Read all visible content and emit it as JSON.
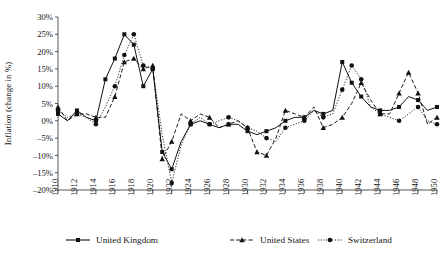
{
  "chart_data": {
    "type": "line",
    "title": "",
    "xlabel": "",
    "ylabel": "Inflation (change in %)",
    "xlim": [
      1910,
      1950
    ],
    "ylim": [
      -20,
      30
    ],
    "ytick_step": 5,
    "xtick_step": 2,
    "grid": false,
    "legend_position": "bottom",
    "ytick_labels": [
      "30%",
      "25%",
      "20%",
      "15%",
      "10%",
      "5%",
      "0%",
      "–5%",
      "–10%",
      "–15%",
      "–20%"
    ],
    "ytick_values": [
      30,
      25,
      20,
      15,
      10,
      5,
      0,
      -5,
      -10,
      -15,
      -20
    ],
    "xtick_labels": [
      "1910",
      "1912",
      "1914",
      "1916",
      "1918",
      "1920",
      "1922",
      "1924",
      "1926",
      "1928",
      "1930",
      "1932",
      "1934",
      "1936",
      "1938",
      "1940",
      "1942",
      "1944",
      "1946",
      "1948",
      "1950"
    ],
    "xtick_values": [
      1910,
      1912,
      1914,
      1916,
      1918,
      1920,
      1922,
      1924,
      1926,
      1928,
      1930,
      1932,
      1934,
      1936,
      1938,
      1940,
      1942,
      1944,
      1946,
      1948,
      1950
    ],
    "x": [
      1910,
      1911,
      1912,
      1913,
      1914,
      1915,
      1916,
      1917,
      1918,
      1919,
      1920,
      1921,
      1922,
      1923,
      1924,
      1925,
      1926,
      1927,
      1928,
      1929,
      1930,
      1931,
      1932,
      1933,
      1934,
      1935,
      1936,
      1937,
      1938,
      1939,
      1940,
      1941,
      1942,
      1943,
      1944,
      1945,
      1946,
      1947,
      1948,
      1949,
      1950
    ],
    "series": [
      {
        "name": "United Kingdom",
        "marker": "square",
        "line_style": "solid",
        "color": "#111111",
        "values": [
          2,
          0,
          3,
          1,
          0,
          12,
          18,
          25,
          22,
          10,
          15,
          -9,
          -14,
          -6,
          -1,
          0,
          -1,
          -2,
          -1,
          -1,
          -3,
          -4,
          -3,
          -2,
          0,
          1,
          1,
          3,
          2,
          3,
          17,
          11,
          7,
          4,
          3,
          3,
          4,
          7,
          6,
          3,
          4
        ]
      },
      {
        "name": "United States",
        "marker": "triangle",
        "line_style": "dashed",
        "color": "#111111",
        "values": [
          4,
          0,
          2,
          2,
          1,
          1,
          7,
          17,
          18,
          15,
          16,
          -11,
          -6,
          2,
          0,
          2,
          1,
          -2,
          -1,
          0,
          -2,
          -9,
          -10,
          -5,
          3,
          2,
          1,
          4,
          -2,
          -1,
          1,
          5,
          11,
          6,
          2,
          2,
          8,
          14,
          8,
          -1,
          1
        ]
      },
      {
        "name": "Switzerland",
        "marker": "circle",
        "line_style": "dotted",
        "color": "#111111",
        "values": [
          3,
          1,
          2,
          1,
          -1,
          4,
          10,
          19,
          25,
          16,
          15,
          -4,
          -18,
          -7,
          -1,
          1,
          -1,
          0,
          1,
          0,
          -2,
          -3,
          -5,
          -6,
          -2,
          -1,
          0,
          3,
          1,
          2,
          9,
          16,
          12,
          4,
          2,
          1,
          0,
          2,
          4,
          0,
          -1
        ]
      }
    ]
  }
}
